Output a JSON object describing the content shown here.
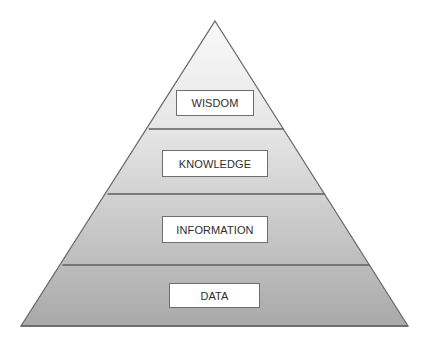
{
  "diagram": {
    "type": "pyramid",
    "apex": [
      215,
      21
    ],
    "base_left": [
      21,
      326
    ],
    "base_right": [
      408,
      326
    ],
    "colors": {
      "top_fill": "#f8f8f8",
      "bottom_fill": "#a9a9a9",
      "outline": "#6a6a6a",
      "label_bg": "#ffffff",
      "label_text": "#2e2e2e"
    },
    "levels": [
      {
        "label": "WISDOM",
        "divider_y": 129,
        "box": {
          "x": 176,
          "y": 90,
          "w": 78,
          "h": 26
        }
      },
      {
        "label": "KNOWLEDGE",
        "divider_y": 194,
        "box": {
          "x": 162,
          "y": 150,
          "w": 106,
          "h": 27
        }
      },
      {
        "label": "INFORMATION",
        "divider_y": 265,
        "box": {
          "x": 162,
          "y": 216,
          "w": 106,
          "h": 27
        }
      },
      {
        "label": "DATA",
        "divider_y": 326,
        "box": {
          "x": 169,
          "y": 283,
          "w": 91,
          "h": 25
        }
      }
    ]
  }
}
